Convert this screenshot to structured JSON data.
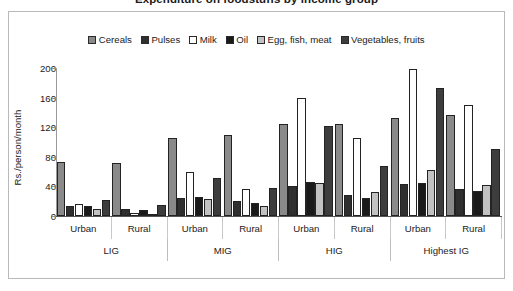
{
  "chart_data": {
    "type": "bar",
    "title": "Expenditure on foodstuffs by income group",
    "xlabel": "",
    "ylabel": "Rs./person/month",
    "ylim": [
      0,
      200
    ],
    "yticks": [
      0,
      40,
      80,
      120,
      160,
      200
    ],
    "grid": false,
    "legend_position": "top-center",
    "group_labels": [
      "LIG",
      "MIG",
      "HIG",
      "Highest IG"
    ],
    "subgroup_labels": [
      "Urban",
      "Rural"
    ],
    "categories": [
      "LIG Urban",
      "LIG Rural",
      "MIG Urban",
      "MIG Rural",
      "HIG Urban",
      "HIG Rural",
      "Highest IG Urban",
      "Highest IG Rural"
    ],
    "series": [
      {
        "name": "Cereals",
        "color": "#8a8a8a",
        "values": [
          73,
          72,
          106,
          110,
          124,
          124,
          133,
          137
        ]
      },
      {
        "name": "Pulses",
        "color": "#2f2f2f",
        "values": [
          14,
          9,
          25,
          20,
          40,
          28,
          43,
          37
        ]
      },
      {
        "name": "Milk",
        "color": "#ffffff",
        "values": [
          16,
          4,
          60,
          36,
          159,
          106,
          199,
          150
        ]
      },
      {
        "name": "Oil",
        "color": "#1a1a1a",
        "values": [
          13,
          8,
          26,
          18,
          46,
          25,
          45,
          34
        ]
      },
      {
        "name": "Egg, fish, meat",
        "color": "#c2c2c2",
        "values": [
          9,
          3,
          23,
          14,
          44,
          32,
          62,
          42
        ]
      },
      {
        "name": "Vegetables, fruits",
        "color": "#3d3d3d",
        "values": [
          21,
          15,
          52,
          38,
          122,
          68,
          173,
          91
        ]
      }
    ]
  },
  "legend": {
    "items": [
      {
        "label": "Cereals"
      },
      {
        "label": "Pulses"
      },
      {
        "label": "Milk"
      },
      {
        "label": "Oil"
      },
      {
        "label": "Egg, fish, meat"
      },
      {
        "label": "Vegetables, fruits"
      }
    ]
  },
  "axis": {
    "y_label": "Rs./person/month",
    "y_ticks": [
      "200",
      "160",
      "120",
      "80",
      "40",
      "0"
    ]
  },
  "x_axis": {
    "tier1": [
      "Urban",
      "Rural",
      "Urban",
      "Rural",
      "Urban",
      "Rural",
      "Urban",
      "Rural"
    ],
    "tier2": [
      "LIG",
      "MIG",
      "HIG",
      "Highest IG"
    ]
  }
}
